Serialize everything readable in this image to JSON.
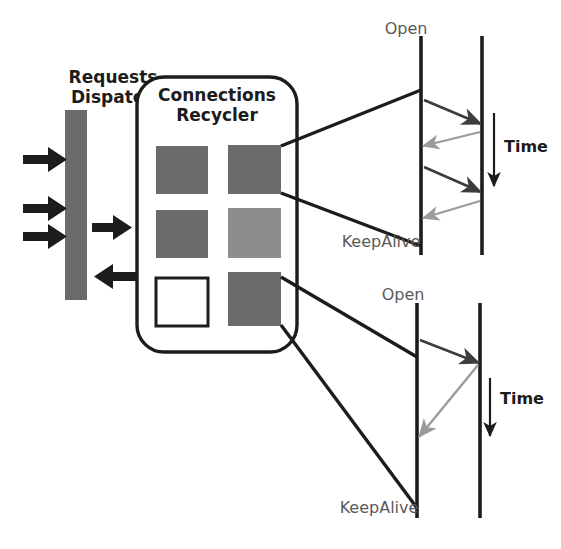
{
  "figure": {
    "background": "#ffffff"
  },
  "colors": {
    "stroke_dark": "#1c1c1c",
    "stroke_light": "#9b9b9b",
    "slot_fill_dark": "#6b6b6b",
    "slot_fill_light": "#8d8d8d",
    "slot_fill_empty": "#ffffff",
    "dispatch_bar_fill": "#6b6b6b",
    "label_gray": "#5a5a5a"
  },
  "dispatch": {
    "label_line1": "Requests",
    "label_line2": "Dispatch",
    "bar": {
      "x": 65,
      "y": 110,
      "width": 22,
      "height": 190
    },
    "inbound_arrows": 3,
    "outbound_arrows": 1,
    "return_arrows": 1
  },
  "recycler": {
    "label_line1": "Connections",
    "label_line2": "Recycler",
    "box": {
      "x": 137,
      "y": 77,
      "width": 160,
      "height": 275,
      "radius": 26
    },
    "slots": [
      {
        "id": "slot-0-0",
        "state": "busy",
        "fill": "#6b6b6b"
      },
      {
        "id": "slot-0-1",
        "state": "busy",
        "fill": "#6b6b6b"
      },
      {
        "id": "slot-1-0",
        "state": "busy",
        "fill": "#6b6b6b"
      },
      {
        "id": "slot-1-1",
        "state": "idle",
        "fill": "#8d8d8d"
      },
      {
        "id": "slot-2-0",
        "state": "free",
        "fill": "#ffffff"
      },
      {
        "id": "slot-2-1",
        "state": "busy",
        "fill": "#6b6b6b"
      }
    ]
  },
  "timelines": [
    {
      "id": "timeline-top",
      "open_label": "Open",
      "keepalive_label": "KeepAlive",
      "time_label": "Time",
      "client_line": {
        "x": 421,
        "y1": 36,
        "y2": 255
      },
      "server_line": {
        "x": 482,
        "y1": 36,
        "y2": 255
      },
      "messages": [
        {
          "direction": "request",
          "color": "#3d3d3d",
          "from_y": 100,
          "to_y": 124
        },
        {
          "direction": "response",
          "color": "#9b9b9b",
          "from_y": 132,
          "to_y": 146
        },
        {
          "direction": "request",
          "color": "#3d3d3d",
          "from_y": 167,
          "to_y": 192
        },
        {
          "direction": "response",
          "color": "#9b9b9b",
          "from_y": 201,
          "to_y": 218
        }
      ],
      "time_arrow": {
        "x": 494,
        "y1": 113,
        "y2": 190
      }
    },
    {
      "id": "timeline-bottom",
      "open_label": "Open",
      "keepalive_label": "KeepAlive",
      "time_label": "Time",
      "client_line": {
        "x": 417,
        "y1": 303,
        "y2": 518
      },
      "server_line": {
        "x": 480,
        "y1": 303,
        "y2": 518
      },
      "messages": [
        {
          "direction": "request",
          "color": "#3d3d3d",
          "from_y": 340,
          "to_y": 363
        },
        {
          "direction": "response",
          "color": "#9b9b9b",
          "from_y": 365,
          "to_y": 437
        }
      ],
      "time_arrow": {
        "x": 490,
        "y1": 378,
        "y2": 440
      }
    }
  ],
  "connectors": [
    {
      "id": "connector-top-upper",
      "from": "slot-0-1-topright",
      "to": "timeline-top-client-upper"
    },
    {
      "id": "connector-top-lower",
      "from": "slot-0-1-bottomright",
      "to": "timeline-top-client-lower"
    },
    {
      "id": "connector-bottom-upper",
      "from": "slot-2-1-topright",
      "to": "timeline-bottom-client-upper"
    },
    {
      "id": "connector-bottom-lower",
      "from": "slot-2-1-bottomright",
      "to": "timeline-bottom-client-lower"
    }
  ]
}
